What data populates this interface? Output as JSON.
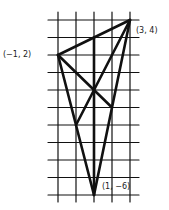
{
  "diagram": {
    "grid": {
      "x_min": -1,
      "x_max": 3,
      "y_min": -6,
      "y_max": 4,
      "origin_px": [
        58,
        20
      ],
      "x_step_px": 18,
      "y_step_px": 17.5,
      "h_line_extent_px": [
        48,
        139
      ],
      "v_line_extent_px": [
        12,
        202
      ]
    },
    "points": [
      {
        "id": "A",
        "x": -1,
        "y": 2,
        "label": "(−1, 2)"
      },
      {
        "id": "B",
        "x": 3,
        "y": 4,
        "label": "(3, 4)"
      },
      {
        "id": "C",
        "x": 1,
        "y": -6,
        "label": "(1, −6)"
      }
    ],
    "segments": [
      {
        "from": [
          -1,
          2
        ],
        "to": [
          3,
          4
        ]
      },
      {
        "from": [
          3,
          4
        ],
        "to": [
          1,
          -6
        ]
      },
      {
        "from": [
          -1,
          2
        ],
        "to": [
          1,
          -6
        ]
      },
      {
        "from": [
          -1,
          2
        ],
        "to": [
          2,
          -1
        ]
      },
      {
        "from": [
          3,
          4
        ],
        "to": [
          0,
          -2
        ]
      },
      {
        "from": [
          1,
          3
        ],
        "to": [
          1,
          -6
        ]
      }
    ],
    "line_color": "#111111",
    "grid_color": "#111111"
  }
}
